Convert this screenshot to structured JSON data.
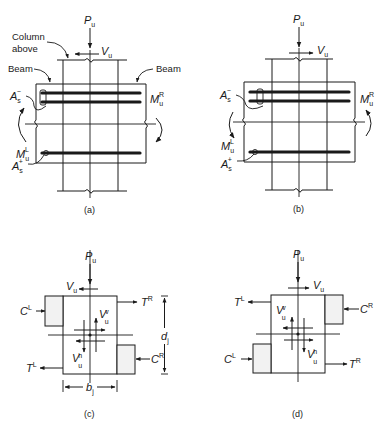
{
  "figure": {
    "panels": [
      {
        "id": "a",
        "caption": "(a)",
        "labels": {
          "axial_load": "P",
          "axial_load_sub": "u",
          "column_shear": "V",
          "column_shear_sub": "u",
          "column_above_line1": "Column",
          "column_above_line2": "above",
          "beam_left": "Beam",
          "beam_right": "Beam",
          "top_steel": "A",
          "top_steel_sub": "s",
          "top_steel_sup": "−",
          "bottom_steel": "A",
          "bottom_steel_sub": "s",
          "bottom_steel_sup": "+",
          "moment_right": "M",
          "moment_right_sub": "u",
          "moment_right_sup": "R",
          "moment_left": "M",
          "moment_left_sub": "u",
          "moment_left_sup": "L"
        }
      },
      {
        "id": "b",
        "caption": "(b)",
        "labels": {
          "axial_load": "P",
          "axial_load_sub": "u",
          "column_shear": "V",
          "column_shear_sub": "u",
          "top_steel": "A",
          "top_steel_sub": "s",
          "top_steel_sup": "−",
          "bottom_steel": "A",
          "bottom_steel_sub": "s",
          "bottom_steel_sup": "+",
          "moment_right": "M",
          "moment_right_sub": "u",
          "moment_right_sup": "R",
          "moment_left": "M",
          "moment_left_sub": "u",
          "moment_left_sup": "L"
        }
      },
      {
        "id": "c",
        "caption": "(c)",
        "labels": {
          "axial_load": "P",
          "axial_load_sub": "u",
          "column_shear": "V",
          "column_shear_sub": "u",
          "comp_left": "C",
          "comp_left_sup": "L",
          "tension_right": "T",
          "tension_right_sup": "R",
          "tension_left": "T",
          "tension_left_sup": "L",
          "comp_right": "C",
          "comp_right_sup": "R",
          "joint_shear_v": "V",
          "joint_shear_v_sub": "u",
          "joint_shear_v_sup": "v",
          "joint_shear_h": "V",
          "joint_shear_h_sub": "u",
          "joint_shear_h_sup": "h",
          "joint_depth": "d",
          "joint_depth_sub": "j",
          "joint_width": "b",
          "joint_width_sub": "j"
        }
      },
      {
        "id": "d",
        "caption": "(d)",
        "labels": {
          "axial_load": "P",
          "axial_load_sub": "u",
          "column_shear": "V",
          "column_shear_sub": "u",
          "tension_left": "T",
          "tension_left_sup": "L",
          "comp_right": "C",
          "comp_right_sup": "R",
          "comp_left": "C",
          "comp_left_sup": "L",
          "tension_right": "T",
          "tension_right_sup": "R",
          "joint_shear_v": "V",
          "joint_shear_v_sub": "u",
          "joint_shear_v_sup": "v",
          "joint_shear_h": "V",
          "joint_shear_h_sub": "u",
          "joint_shear_h_sup": "h"
        }
      }
    ],
    "colors": {
      "ink": "#1a1a1a",
      "block_fill": "#f2f2f2",
      "background": "#ffffff"
    }
  }
}
